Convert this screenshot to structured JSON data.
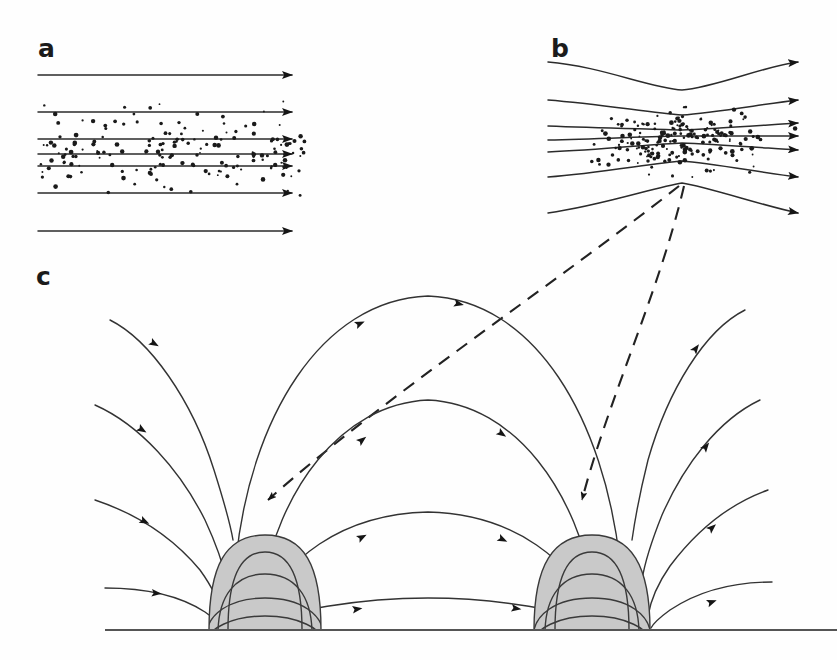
{
  "figure": {
    "background_color": "#fefefe",
    "line_color": "#2b2b2b",
    "dome_fill_color": "#c9c9c9",
    "particle_color": "#1a1a1a",
    "dash_color": "#222222",
    "width": 837,
    "height": 660
  },
  "panels": [
    {
      "id": "a",
      "label": "a",
      "label_x": 38,
      "label_y": 57,
      "description": "Uniform horizontal magnetic field lines with diffuse particle population",
      "field_lines": [
        {
          "name": "line-a-1",
          "y": 75,
          "x_start": 38,
          "x_end": 300
        },
        {
          "name": "line-a-2",
          "y": 112,
          "x_start": 38,
          "x_end": 300
        },
        {
          "name": "line-a-3",
          "y": 139,
          "x_start": 38,
          "x_end": 300
        },
        {
          "name": "line-a-4",
          "y": 154,
          "x_start": 38,
          "x_end": 300
        },
        {
          "name": "line-a-5",
          "y": 166,
          "x_start": 38,
          "x_end": 300
        },
        {
          "name": "line-a-6",
          "y": 193,
          "x_start": 38,
          "x_end": 300
        },
        {
          "name": "line-a-7",
          "y": 231,
          "x_start": 38,
          "x_end": 300
        }
      ],
      "particle_band": {
        "x_min": 40,
        "x_max": 305,
        "y_min": 88,
        "y_max": 212,
        "count": 170
      }
    },
    {
      "id": "b",
      "label": "b",
      "label_x": 551,
      "label_y": 57,
      "description": "Pinched / converging magnetic field lines with particles concentrated at the neck",
      "pinch_x": 682,
      "field_lines": [
        {
          "name": "line-b-1",
          "y_left": 62,
          "y_pinch": 90,
          "y_right": 62
        },
        {
          "name": "line-b-2",
          "y_left": 100,
          "y_pinch": 115,
          "y_right": 100
        },
        {
          "name": "line-b-3",
          "y_left": 126,
          "y_pinch": 130,
          "y_right": 123
        },
        {
          "name": "line-b-4",
          "y_left": 140,
          "y_pinch": 136,
          "y_right": 136
        },
        {
          "name": "line-b-5",
          "y_left": 152,
          "y_pinch": 143,
          "y_right": 150
        },
        {
          "name": "line-b-6",
          "y_left": 177,
          "y_pinch": 161,
          "y_right": 177
        },
        {
          "name": "line-b-7",
          "y_left": 213,
          "y_pinch": 183,
          "y_right": 213
        }
      ],
      "x_start": 548,
      "x_end": 806,
      "particle_band": {
        "x_min": 560,
        "x_max": 800,
        "y_min": 95,
        "y_max": 190,
        "count": 190
      }
    },
    {
      "id": "c",
      "label": "c",
      "label_x": 36,
      "label_y": 285,
      "description": "Two emerging flux domes on a surface with arched field lines connecting and diverging",
      "baseline": {
        "y": 630,
        "x_start": 105,
        "x_end": 837
      },
      "domes": [
        {
          "name": "dome-left",
          "cx": 265,
          "base_half_width": 56,
          "base_y": 630,
          "top_y": 535,
          "inner_arcs": 4
        },
        {
          "name": "dome-right",
          "cx": 592,
          "base_half_width": 58,
          "base_y": 630,
          "top_y": 535,
          "inner_arcs": 4
        }
      ]
    }
  ],
  "dashed_connectors": [
    {
      "name": "dashed-connector-left",
      "from_x": 680,
      "from_y": 184,
      "to_x": 262,
      "to_y": 519,
      "arrow": "down"
    },
    {
      "name": "dashed-connector-right",
      "from_x": 684,
      "from_y": 184,
      "to_x": 580,
      "to_y": 519,
      "arrow": "down"
    }
  ],
  "chart_data": {
    "type": "diagram",
    "panel_ids": [
      "a",
      "b",
      "c"
    ],
    "panel_captions": {
      "a": "Uniform horizontal field lines threaded by a diffuse particle population",
      "b": "Field lines pinched at a neck; particles concentrate in the converging region",
      "c": "Two grey flux domes rooted on a surface; field lines arch over and between them"
    },
    "annotations": [
      "dashed arrows map the pinch region in panel b onto each dome apex in panel c"
    ]
  }
}
